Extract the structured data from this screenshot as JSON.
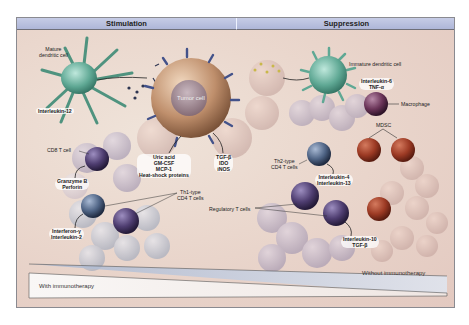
{
  "headers": {
    "left": "Stimulation",
    "right": "Suppression"
  },
  "cells": {
    "mature_dc": "Mature\ndendritic cell",
    "tumor": "Tumor cell",
    "immature_dc": "Immature dendritic cell",
    "macrophage": "Macrophage",
    "mdsc": "MDSC",
    "cd8": "CD8 T cell",
    "th1": "Th1-type\nCD4 T cells",
    "th2": "Th2-type\nCD4 T cells",
    "treg": "Regulatory T cells"
  },
  "factors": {
    "il12": "Interleukin-12",
    "tumor_left": [
      "Uric acid",
      "GM-CSF",
      "MCP-1",
      "Heat-shock proteins"
    ],
    "tumor_right": [
      "TGF-β",
      "IDO",
      "iNOS"
    ],
    "immature_dc": [
      "Interleukin-6",
      "TNF-α"
    ],
    "cd8": [
      "Granzyme B",
      "Perforin"
    ],
    "th1": [
      "Interferon-γ",
      "Interleukin-2"
    ],
    "th2": [
      "Interleukin-4",
      "Interleukin-13"
    ],
    "treg": [
      "Interleukin-10",
      "TGF-β"
    ]
  },
  "gradient": {
    "with": "With immunotherapy",
    "without": "Without immunotherapy"
  },
  "colors": {
    "header_bg": "#b4bcdc",
    "dc_green": "#5fa894",
    "tumor_brown": "#b98a6a",
    "mdsc_red": "#9c3a24",
    "t_purple": "#4e3d70",
    "t_blue": "#4f6485",
    "gradient_blue": "#c7d2e4"
  }
}
